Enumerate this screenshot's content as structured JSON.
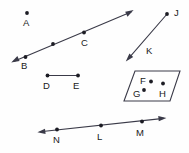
{
  "diagram": {
    "canvas": {
      "width": 189,
      "height": 153
    },
    "colors": {
      "background": "#fefefe",
      "stroke": "#3a3a48",
      "point": "#1c1c24",
      "label": "#1a1a22"
    },
    "labels": [
      {
        "id": "label-a",
        "text": "A",
        "x": 23,
        "y": 18
      },
      {
        "id": "label-b",
        "text": "B",
        "x": 21,
        "y": 61
      },
      {
        "id": "label-c",
        "text": "C",
        "x": 81,
        "y": 38
      },
      {
        "id": "label-d",
        "text": "D",
        "x": 43,
        "y": 81
      },
      {
        "id": "label-e",
        "text": "E",
        "x": 73,
        "y": 81
      },
      {
        "id": "label-f",
        "text": "F",
        "x": 140,
        "y": 76
      },
      {
        "id": "label-g",
        "text": "G",
        "x": 133,
        "y": 89
      },
      {
        "id": "label-h",
        "text": "H",
        "x": 159,
        "y": 89
      },
      {
        "id": "label-j",
        "text": "J",
        "x": 174,
        "y": 8
      },
      {
        "id": "label-k",
        "text": "K",
        "x": 146,
        "y": 46
      },
      {
        "id": "label-l",
        "text": "L",
        "x": 97,
        "y": 132
      },
      {
        "id": "label-m",
        "text": "M",
        "x": 136,
        "y": 128
      },
      {
        "id": "label-n",
        "text": "N",
        "x": 53,
        "y": 135
      }
    ],
    "points": [
      {
        "id": "point-a",
        "label": "A",
        "x": 27,
        "y": 13,
        "r": 1.9
      },
      {
        "id": "point-b",
        "label": "B",
        "x": 25.5,
        "y": 57,
        "r": 1.9
      },
      {
        "id": "point-ab-mid",
        "label": "",
        "x": 53,
        "y": 44,
        "r": 1.9
      },
      {
        "id": "point-c",
        "label": "C",
        "x": 84,
        "y": 32.5,
        "r": 1.9
      },
      {
        "id": "point-d",
        "label": "D",
        "x": 47.5,
        "y": 75.5,
        "r": 1.9
      },
      {
        "id": "point-e",
        "label": "E",
        "x": 78,
        "y": 75.5,
        "r": 1.9
      },
      {
        "id": "point-f",
        "label": "F",
        "x": 151,
        "y": 81.5,
        "r": 1.9
      },
      {
        "id": "point-g",
        "label": "G",
        "x": 144,
        "y": 90,
        "r": 1.9
      },
      {
        "id": "point-h",
        "label": "H",
        "x": 163,
        "y": 83.5,
        "r": 1.9
      },
      {
        "id": "point-j",
        "label": "J",
        "x": 167,
        "y": 14,
        "r": 1.9
      },
      {
        "id": "point-n",
        "label": "N",
        "x": 57,
        "y": 129.5,
        "r": 1.9
      },
      {
        "id": "point-l",
        "label": "L",
        "x": 101,
        "y": 125.5,
        "r": 1.9
      },
      {
        "id": "point-m",
        "label": "M",
        "x": 142,
        "y": 121.5,
        "r": 1.9
      }
    ],
    "shapes": {
      "line_abc": {
        "name": "line-through-b-c",
        "from": {
          "x": 12,
          "y": 62
        },
        "to": {
          "x": 133,
          "y": 11
        },
        "arrow_start": true,
        "arrow_end": true
      },
      "segment_jk": {
        "name": "segment-j-k",
        "from": {
          "x": 167,
          "y": 14
        },
        "to": {
          "x": 126,
          "y": 61
        },
        "arrow_start": false,
        "arrow_end": true
      },
      "segment_de": {
        "name": "segment-d-e",
        "from": {
          "x": 47.5,
          "y": 75.5
        },
        "to": {
          "x": 78,
          "y": 75.5
        },
        "arrow_start": false,
        "arrow_end": false
      },
      "line_nlm": {
        "name": "line-through-n-l-m",
        "from": {
          "x": 38,
          "y": 132
        },
        "to": {
          "x": 166,
          "y": 118
        },
        "arrow_start": true,
        "arrow_end": true
      },
      "parallelogram": {
        "name": "parallelogram-fgh",
        "vertices": "135,71 180,71 170,101 124,101"
      }
    }
  }
}
